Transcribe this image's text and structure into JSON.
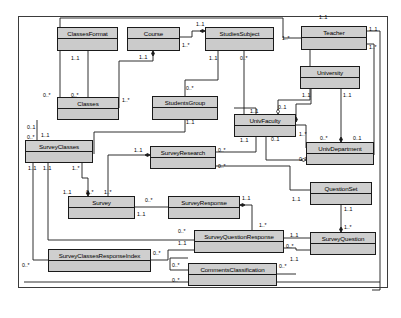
{
  "diagram": {
    "type": "uml-class-diagram",
    "classes": [
      {
        "id": "classes-format",
        "name": "ClassesFormat",
        "x": 57,
        "y": 27,
        "w": 61,
        "h": 24
      },
      {
        "id": "course",
        "name": "Course",
        "x": 127,
        "y": 27,
        "w": 53,
        "h": 24
      },
      {
        "id": "studies-subject",
        "name": "StudiesSubject",
        "x": 205,
        "y": 27,
        "w": 69,
        "h": 24
      },
      {
        "id": "teacher",
        "name": "Teacher",
        "x": 301,
        "y": 26,
        "w": 66,
        "h": 24
      },
      {
        "id": "university",
        "name": "University",
        "x": 300,
        "y": 66,
        "w": 60,
        "h": 23
      },
      {
        "id": "classes",
        "name": "Classes",
        "x": 57,
        "y": 97,
        "w": 62,
        "h": 23
      },
      {
        "id": "students-group",
        "name": "StudentsGroup",
        "x": 152,
        "y": 96,
        "w": 66,
        "h": 24
      },
      {
        "id": "univ-faculty",
        "name": "UnivFaculty",
        "x": 234,
        "y": 114,
        "w": 62,
        "h": 23
      },
      {
        "id": "univ-department",
        "name": "UnivDepartment",
        "x": 306,
        "y": 142,
        "w": 68,
        "h": 23
      },
      {
        "id": "survey-classes",
        "name": "SurveyClasses",
        "x": 25,
        "y": 140,
        "w": 68,
        "h": 23
      },
      {
        "id": "survey-research",
        "name": "SurveyResearch",
        "x": 150,
        "y": 146,
        "w": 66,
        "h": 23
      },
      {
        "id": "question-set",
        "name": "QuestionSet",
        "x": 310,
        "y": 182,
        "w": 62,
        "h": 23
      },
      {
        "id": "survey",
        "name": "Survey",
        "x": 68,
        "y": 196,
        "w": 67,
        "h": 23
      },
      {
        "id": "survey-response",
        "name": "SurveyResponse",
        "x": 168,
        "y": 196,
        "w": 72,
        "h": 23
      },
      {
        "id": "survey-question",
        "name": "SurveyQuestion",
        "x": 310,
        "y": 232,
        "w": 66,
        "h": 23
      },
      {
        "id": "survey-question-response",
        "name": "SurveyQuestionResponse",
        "x": 194,
        "y": 230,
        "w": 90,
        "h": 23
      },
      {
        "id": "survey-classes-resp-idx",
        "name": "SurveyClassesResponseIndex",
        "x": 48,
        "y": 249,
        "w": 103,
        "h": 23
      },
      {
        "id": "comments-classification",
        "name": "CommentsClassification",
        "x": 188,
        "y": 263,
        "w": 89,
        "h": 23
      }
    ],
    "multiplicities": [
      {
        "id": "m01",
        "text": "1..1",
        "x": 319,
        "y": 14
      },
      {
        "id": "m02",
        "text": "1..1",
        "x": 196,
        "y": 21
      },
      {
        "id": "m03",
        "text": "1..1",
        "x": 369,
        "y": 26
      },
      {
        "id": "m04",
        "text": "1..*",
        "x": 182,
        "y": 42
      },
      {
        "id": "m05",
        "text": "1..*",
        "x": 282,
        "y": 35
      },
      {
        "id": "m06",
        "text": "1..*",
        "x": 369,
        "y": 44
      },
      {
        "id": "m07",
        "text": "1..1",
        "x": 71,
        "y": 55
      },
      {
        "id": "m08",
        "text": "1..1",
        "x": 139,
        "y": 54
      },
      {
        "id": "m09",
        "text": "1..1",
        "x": 209,
        "y": 55
      },
      {
        "id": "m10",
        "text": "0..*",
        "x": 240,
        "y": 55
      },
      {
        "id": "m11",
        "text": "1..1",
        "x": 302,
        "y": 92
      },
      {
        "id": "m12",
        "text": "1..1",
        "x": 343,
        "y": 92
      },
      {
        "id": "m13",
        "text": "0..*",
        "x": 43,
        "y": 92
      },
      {
        "id": "m14",
        "text": "0..*",
        "x": 71,
        "y": 92
      },
      {
        "id": "m15",
        "text": "0..*",
        "x": 186,
        "y": 85
      },
      {
        "id": "m16",
        "text": "1..*",
        "x": 122,
        "y": 97
      },
      {
        "id": "m17",
        "text": "1..1",
        "x": 250,
        "y": 108
      },
      {
        "id": "m18",
        "text": "0..1",
        "x": 278,
        "y": 104
      },
      {
        "id": "m19",
        "text": "0..1",
        "x": 353,
        "y": 135
      },
      {
        "id": "m20",
        "text": "0..*",
        "x": 320,
        "y": 135
      },
      {
        "id": "m21",
        "text": "1..*",
        "x": 299,
        "y": 131
      },
      {
        "id": "m22",
        "text": "0..1",
        "x": 27,
        "y": 124
      },
      {
        "id": "m23",
        "text": "1..1",
        "x": 41,
        "y": 132
      },
      {
        "id": "m24",
        "text": "0..*",
        "x": 27,
        "y": 134
      },
      {
        "id": "m25",
        "text": "1..1",
        "x": 240,
        "y": 137
      },
      {
        "id": "m26",
        "text": "0..1",
        "x": 271,
        "y": 136
      },
      {
        "id": "m27",
        "text": "0..*",
        "x": 299,
        "y": 156
      },
      {
        "id": "m28",
        "text": "1..1",
        "x": 186,
        "y": 119
      },
      {
        "id": "m29",
        "text": "1..1",
        "x": 134,
        "y": 147
      },
      {
        "id": "m30",
        "text": "0..*",
        "x": 218,
        "y": 147
      },
      {
        "id": "m31",
        "text": "0..*",
        "x": 218,
        "y": 163
      },
      {
        "id": "m32",
        "text": "1..1",
        "x": 28,
        "y": 165
      },
      {
        "id": "m33",
        "text": "1..1",
        "x": 43,
        "y": 165
      },
      {
        "id": "m34",
        "text": "1..*",
        "x": 72,
        "y": 165
      },
      {
        "id": "m35",
        "text": "1..1",
        "x": 63,
        "y": 189
      },
      {
        "id": "m36",
        "text": "0..*",
        "x": 86,
        "y": 189
      },
      {
        "id": "m37",
        "text": "1..*",
        "x": 104,
        "y": 189
      },
      {
        "id": "m38",
        "text": "0..*",
        "x": 145,
        "y": 197
      },
      {
        "id": "m39",
        "text": "1..1",
        "x": 137,
        "y": 211
      },
      {
        "id": "m40",
        "text": "1..1",
        "x": 242,
        "y": 195
      },
      {
        "id": "m41",
        "text": "1..1",
        "x": 292,
        "y": 196
      },
      {
        "id": "m42",
        "text": "1..1",
        "x": 344,
        "y": 206
      },
      {
        "id": "m43",
        "text": "1..*",
        "x": 344,
        "y": 224
      },
      {
        "id": "m44",
        "text": "1..*",
        "x": 259,
        "y": 222
      },
      {
        "id": "m45",
        "text": "0..*",
        "x": 178,
        "y": 228
      },
      {
        "id": "m46",
        "text": "1..1",
        "x": 178,
        "y": 240
      },
      {
        "id": "m47",
        "text": "1..1",
        "x": 290,
        "y": 232
      },
      {
        "id": "m48",
        "text": "0..*",
        "x": 286,
        "y": 243
      },
      {
        "id": "m49",
        "text": "1..1",
        "x": 290,
        "y": 256
      },
      {
        "id": "m50",
        "text": "0..*",
        "x": 153,
        "y": 250
      },
      {
        "id": "m51",
        "text": "0..*",
        "x": 22,
        "y": 262
      },
      {
        "id": "m52",
        "text": "0..*",
        "x": 172,
        "y": 262
      },
      {
        "id": "m53",
        "text": "0..*",
        "x": 172,
        "y": 277
      },
      {
        "id": "m54",
        "text": "0..*",
        "x": 279,
        "y": 263
      }
    ],
    "edges": [
      {
        "id": "e-classesformat-classes",
        "d": "M 88 51 L 88 97",
        "from": "classes-format",
        "to": "classes",
        "end": "none"
      },
      {
        "id": "e-course-classes",
        "d": "M 153 51 L 153 61 L 119 61 L 119 108",
        "from": "course",
        "to": "classes",
        "end": "filled-diamond-start"
      },
      {
        "id": "e-course-studiessubject",
        "d": "M 180 37 L 192 37 L 192 31 L 205 31",
        "from": "course",
        "to": "studies-subject",
        "end": "filled-diamond-end"
      },
      {
        "id": "e-studiessubject-studentsgroup",
        "d": "M 218 51 L 218 80 L 185 80 L 185 96",
        "from": "studies-subject",
        "to": "students-group",
        "end": "none"
      },
      {
        "id": "e-studiessubject-univfaculty",
        "d": "M 244 51 L 244 114",
        "from": "studies-subject",
        "to": "univ-faculty",
        "end": "none"
      },
      {
        "id": "e-studentsgroup-surveyclasses",
        "d": "M 185 120 L 185 132 L 94 132 L 94 154",
        "from": "students-group",
        "to": "survey-classes",
        "end": "none"
      },
      {
        "id": "e-teacher-univfaculty",
        "d": "M 310 50 L 310 100 L 278 100 L 278 114",
        "from": "teacher",
        "to": "univ-faculty",
        "end": "hollow-diamond"
      },
      {
        "id": "e-teacher-left",
        "d": "M 301 38 L 283 38 L 283 18 L 60 18 L 60 108 L 57 108",
        "from": "teacher",
        "to": "classes",
        "end": "none"
      },
      {
        "id": "e-teacher-right1",
        "d": "M 367 31 L 380 31 L 380 290 L 372 290",
        "from": "teacher",
        "to": "comments-classification",
        "end": "none"
      },
      {
        "id": "e-teacher-right2",
        "d": "M 367 44 L 374 44 L 374 150 L 374 155",
        "from": "teacher",
        "to": "univ-department",
        "end": "none"
      },
      {
        "id": "e-university-univfaculty",
        "d": "M 311 89 L 311 104 L 296 104 L 296 122",
        "from": "university",
        "to": "univ-faculty",
        "end": "filled-diamond"
      },
      {
        "id": "e-university-univdepartment",
        "d": "M 341 89 L 341 142",
        "from": "university",
        "to": "univ-department",
        "end": "filled-diamond"
      },
      {
        "id": "e-univfaculty-univdepartment",
        "d": "M 296 125 L 306 125 L 306 148",
        "from": "univ-faculty",
        "to": "univ-department",
        "end": "none"
      },
      {
        "id": "e-univfaculty-hollow2",
        "d": "M 266 137 L 266 160 L 306 160",
        "from": "univ-faculty",
        "to": "univ-department",
        "end": "hollow-diamond"
      },
      {
        "id": "e-classes-surveyclasses",
        "d": "M 37 120 L 37 140",
        "from": "classes",
        "to": "survey-classes",
        "end": "none"
      },
      {
        "id": "e-surveyclasses-survey",
        "d": "M 82 163 L 82 178 L 88 178 L 88 196",
        "from": "survey-classes",
        "to": "survey",
        "end": "filled-diamond"
      },
      {
        "id": "e-surveyclasses-resp-idx",
        "d": "M 33 163 L 33 260 L 48 260",
        "from": "survey-classes",
        "to": "survey-classes-resp-idx",
        "end": "none"
      },
      {
        "id": "e-surveyclasses-sqr",
        "d": "M 48 163 L 48 240 L 194 240",
        "from": "survey-classes",
        "to": "survey-question-response",
        "end": "none"
      },
      {
        "id": "e-surveyresearch-survey",
        "d": "M 150 155 L 108 155 L 108 190 L 108 196",
        "from": "survey-research",
        "to": "survey",
        "end": "filled-diamond-start"
      },
      {
        "id": "e-surveyresearch-right1",
        "d": "M 216 152 L 256 152 L 256 108 L 234 108",
        "from": "survey-research",
        "to": "univ-faculty",
        "end": "none"
      },
      {
        "id": "e-surveyresearch-right2",
        "d": "M 216 166 L 290 166 L 290 190 L 310 190",
        "from": "survey-research",
        "to": "question-set",
        "end": "none"
      },
      {
        "id": "e-survey-surveyresponse",
        "d": "M 135 207 L 168 207",
        "from": "survey",
        "to": "survey-response",
        "end": "none"
      },
      {
        "id": "e-surveyresponse-sqr",
        "d": "M 240 205 L 252 205 L 252 230",
        "from": "survey-response",
        "to": "survey-question-response",
        "end": "filled-diamond-start"
      },
      {
        "id": "e-questionset-surveyquestion",
        "d": "M 341 205 L 341 232",
        "from": "question-set",
        "to": "survey-question",
        "end": "filled-diamond"
      },
      {
        "id": "e-sqr-surveyquestion",
        "d": "M 284 238 L 310 238",
        "from": "survey-question-response",
        "to": "survey-question",
        "end": "none"
      },
      {
        "id": "e-sqr-surveyquestion2",
        "d": "M 284 248 L 296 248 L 296 250 L 310 250",
        "from": "survey-question-response",
        "to": "survey-question",
        "end": "none"
      },
      {
        "id": "e-respidx-sqr",
        "d": "M 151 260 L 168 260 L 168 250 L 194 250",
        "from": "survey-classes-resp-idx",
        "to": "survey-question-response",
        "end": "none"
      },
      {
        "id": "e-comments-left",
        "d": "M 188 270 L 170 270 L 170 258 L 188 258",
        "from": "comments-classification",
        "to": "survey-question-response",
        "end": "none"
      },
      {
        "id": "e-comments-right",
        "d": "M 277 274 L 296 274",
        "from": "comments-classification",
        "to": "survey-question",
        "end": "none"
      },
      {
        "id": "e-bottom-frame",
        "d": "M 24 282 L 380 282",
        "from": "frame",
        "to": "frame",
        "end": "none"
      }
    ]
  }
}
